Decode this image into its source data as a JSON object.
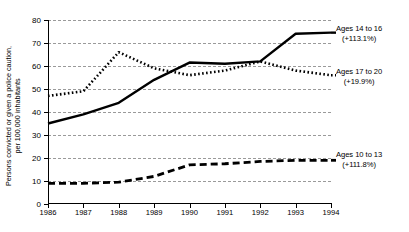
{
  "chart_data": {
    "type": "line",
    "title": "",
    "xlabel": "",
    "ylabel": "Persons convicted or given a police caution, per 100,000 inhabitants",
    "ylabel_line1": "Persons convicted or given a police caution,",
    "ylabel_line2": "per 100,000 inhabitants",
    "categories": [
      "1986",
      "1987",
      "1988",
      "1989",
      "1990",
      "1991",
      "1992",
      "1993",
      "1994"
    ],
    "x": [
      1986,
      1987,
      1988,
      1989,
      1990,
      1991,
      1992,
      1993,
      1994
    ],
    "ylim": [
      0,
      80
    ],
    "yticks": [
      0,
      10,
      20,
      30,
      40,
      50,
      60,
      70,
      80
    ],
    "grid": true,
    "legend_position": "right-of-plot (inline end-of-line annotations)",
    "series": [
      {
        "name": "Ages 14 to 16",
        "change_label": "(+113.1%)",
        "style": "solid",
        "color": "#000000",
        "values": [
          35,
          39,
          44,
          54,
          61.5,
          61,
          62,
          74,
          74.5
        ]
      },
      {
        "name": "Ages 17 to 20",
        "change_label": "(+19.9%)",
        "style": "dotted",
        "color": "#000000",
        "values": [
          47,
          49,
          66,
          59,
          56,
          58,
          62,
          58,
          56
        ]
      },
      {
        "name": "Ages 10 to 13",
        "change_label": "(+111.8%)",
        "style": "dashed",
        "color": "#000000",
        "values": [
          9,
          9,
          9.5,
          12,
          17,
          17.5,
          18.5,
          19,
          19
        ]
      }
    ],
    "annotations": [
      {
        "label": "Ages 14 to 16",
        "sub": "(+113.1%)"
      },
      {
        "label": "Ages 17 to 20",
        "sub": "(+19.9%)"
      },
      {
        "label": "Ages 10 to 13",
        "sub": "(+111.8%)"
      }
    ]
  },
  "axis": {
    "ytick_labels": [
      "0",
      "10",
      "20",
      "30",
      "40",
      "50",
      "60",
      "70",
      "80"
    ],
    "xtick_labels": [
      "1986",
      "1987",
      "1988",
      "1989",
      "1990",
      "1991",
      "1992",
      "1993",
      "1994"
    ]
  },
  "colors": {
    "ink": "#000000",
    "grid": "#9a9a9a",
    "background": "#ffffff"
  }
}
